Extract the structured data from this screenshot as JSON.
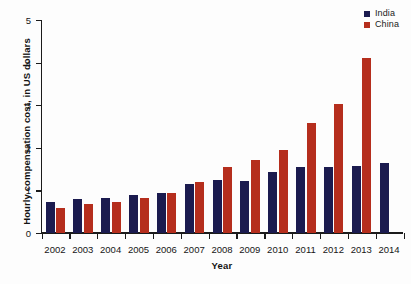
{
  "chart_data": {
    "type": "bar",
    "title": "",
    "xlabel": "Year",
    "ylabel": "Hourly compensation cost, in US dollars",
    "categories": [
      "2002",
      "2003",
      "2004",
      "2005",
      "2006",
      "2007",
      "2008",
      "2009",
      "2010",
      "2011",
      "2012",
      "2013",
      "2014"
    ],
    "series": [
      {
        "name": "India",
        "color": "#1b1b4f",
        "values": [
          0.72,
          0.8,
          0.83,
          0.9,
          0.93,
          1.14,
          1.24,
          1.21,
          1.44,
          1.55,
          1.55,
          1.57,
          1.65
        ]
      },
      {
        "name": "China",
        "color": "#b52e1d",
        "values": [
          0.59,
          0.67,
          0.73,
          0.82,
          0.95,
          1.19,
          1.55,
          1.71,
          1.96,
          2.59,
          3.04,
          4.1,
          null
        ]
      }
    ],
    "ylim": [
      0,
      5
    ],
    "yticks": [
      "0",
      "1",
      "2",
      "3",
      "4",
      "5"
    ],
    "grid": false,
    "legend_position": "top-right"
  },
  "legend": {
    "entries": [
      {
        "label": "India",
        "color": "#1b1b4f"
      },
      {
        "label": "China",
        "color": "#b52e1d"
      }
    ]
  },
  "axes": {
    "y_title": "Hourly compensation cost, in US dollars",
    "x_title": "Year"
  }
}
